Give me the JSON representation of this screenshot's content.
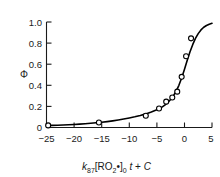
{
  "chart_data": {
    "type": "line",
    "title": "",
    "subtitle": "",
    "xlabel": "k_87 [RO2•]_0 t + C",
    "xlabel_parts": {
      "k": "k",
      "k_sub": "87",
      "bracket_open": "[",
      "species": "RO",
      "species_sub": "2",
      "radical_dot": "•",
      "bracket_close": "]",
      "bracket_sub": "0",
      "t": "t",
      "plus": "+",
      "C": "C"
    },
    "ylabel": "Φ",
    "xlim": [
      -25,
      5
    ],
    "ylim": [
      0,
      1.0
    ],
    "xticks": [
      -25,
      -20,
      -15,
      -10,
      -5,
      0,
      5
    ],
    "xticklabels": [
      "−25",
      "−20",
      "−15",
      "−10",
      "−5",
      "0",
      "5"
    ],
    "yticks": [
      0,
      0.2,
      0.4,
      0.6,
      0.8,
      1.0
    ],
    "yticklabels": [
      "0",
      "0.2",
      "0.4",
      "0.6",
      "0.8",
      "1.0"
    ],
    "grid": false,
    "legend": null,
    "series": [
      {
        "name": "model curve",
        "style": "solid-line",
        "color": "#000000",
        "x": [
          -25.0,
          -24.0,
          -23.0,
          -22.0,
          -21.0,
          -20.0,
          -19.0,
          -18.0,
          -17.0,
          -16.0,
          -15.0,
          -14.0,
          -13.0,
          -12.0,
          -11.0,
          -10.0,
          -9.0,
          -8.0,
          -7.0,
          -6.0,
          -5.0,
          -4.5,
          -4.0,
          -3.5,
          -3.0,
          -2.5,
          -2.0,
          -1.5,
          -1.0,
          -0.5,
          0.0,
          0.5,
          1.0,
          1.5,
          2.0,
          2.5,
          3.0,
          3.5,
          4.0,
          4.5,
          5.0
        ],
        "y": [
          0.018,
          0.02,
          0.022,
          0.024,
          0.026,
          0.029,
          0.032,
          0.036,
          0.04,
          0.045,
          0.05,
          0.056,
          0.063,
          0.071,
          0.08,
          0.09,
          0.101,
          0.114,
          0.129,
          0.147,
          0.168,
          0.18,
          0.196,
          0.215,
          0.238,
          0.265,
          0.3,
          0.345,
          0.4,
          0.47,
          0.55,
          0.635,
          0.715,
          0.785,
          0.845,
          0.89,
          0.925,
          0.95,
          0.967,
          0.979,
          0.988
        ]
      },
      {
        "name": "measured points",
        "style": "open-circle-markers",
        "color": "#000000",
        "marker_fill": "#ffffff",
        "x": [
          -24.7,
          -15.5,
          -7.0,
          -4.6,
          -3.3,
          -2.2,
          -1.3,
          -0.5,
          0.3,
          1.2
        ],
        "y": [
          0.02,
          0.048,
          0.112,
          0.18,
          0.245,
          0.285,
          0.34,
          0.48,
          0.675,
          0.845
        ]
      }
    ]
  },
  "figure": {
    "axis_color": "#1a1a1a",
    "curve_color": "#000000",
    "background": "#ffffff"
  }
}
